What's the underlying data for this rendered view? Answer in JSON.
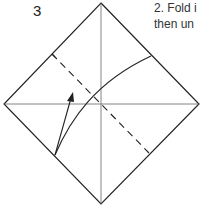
{
  "step": {
    "number": "3",
    "instruction_lines": [
      "2. Fold i",
      "then un"
    ]
  },
  "diagram": {
    "colors": {
      "line": "#222222",
      "crease": "#555555",
      "background": "#ffffff"
    }
  }
}
